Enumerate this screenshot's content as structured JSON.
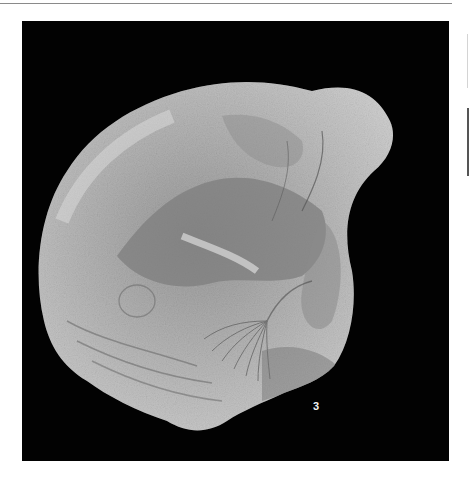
{
  "page": {
    "type": "plate",
    "background": "#ffffff"
  },
  "plate": {
    "background": "#020202",
    "figure": {
      "label": "3",
      "subject": "fossil-shell-specimen",
      "tone": "grayscale"
    }
  },
  "colors": {
    "shell_light": "#d2d2d2",
    "shell_mid": "#a8a8a8",
    "shell_dark": "#7c7c7c",
    "label": "#f2f2f2"
  }
}
